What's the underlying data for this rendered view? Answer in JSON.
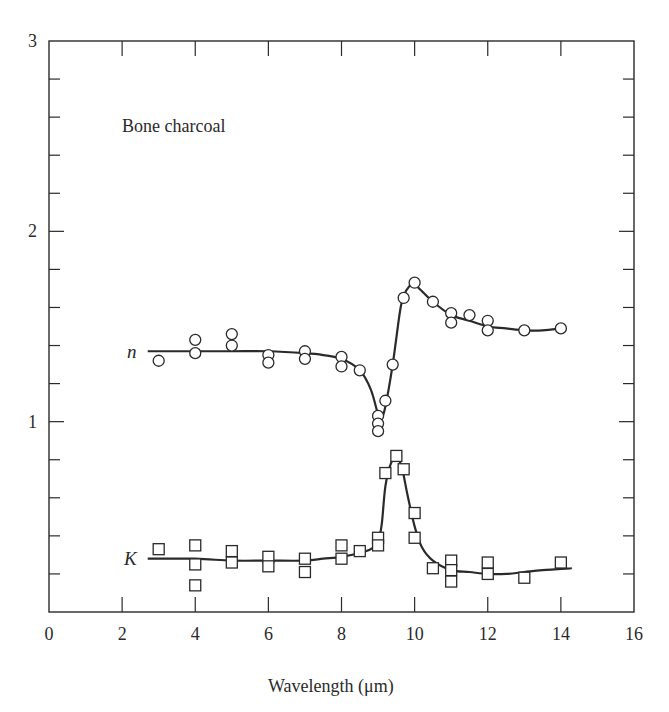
{
  "chart_data": {
    "type": "scatter",
    "title": "",
    "annotation": "Bone charcoal",
    "xlabel": "Wavelength (μm)",
    "ylabel": "",
    "xlim": [
      0,
      16
    ],
    "ylim": [
      0,
      3
    ],
    "x_ticks": [
      0,
      2,
      4,
      6,
      8,
      10,
      12,
      14,
      16
    ],
    "y_ticks": [
      1,
      2,
      3
    ],
    "y_tick_labels": [
      "0",
      "1",
      "2",
      "3"
    ],
    "x_tick_labels": [
      "0",
      "2",
      "4",
      "6",
      "8",
      "10",
      "12",
      "14",
      "16"
    ],
    "y_minor_tick_step": 0.2,
    "grid": false,
    "legend": "none (inline series labels)",
    "series": [
      {
        "name": "n",
        "marker": "circle",
        "points": [
          [
            3,
            1.32
          ],
          [
            4,
            1.43
          ],
          [
            4,
            1.36
          ],
          [
            5,
            1.46
          ],
          [
            5,
            1.4
          ],
          [
            6,
            1.35
          ],
          [
            6,
            1.31
          ],
          [
            7,
            1.37
          ],
          [
            7,
            1.33
          ],
          [
            8,
            1.34
          ],
          [
            8,
            1.29
          ],
          [
            8.5,
            1.27
          ],
          [
            9,
            1.03
          ],
          [
            9,
            0.99
          ],
          [
            9,
            0.95
          ],
          [
            9.2,
            1.11
          ],
          [
            9.4,
            1.3
          ],
          [
            9.7,
            1.65
          ],
          [
            10,
            1.73
          ],
          [
            10.5,
            1.63
          ],
          [
            11,
            1.57
          ],
          [
            11,
            1.52
          ],
          [
            11.5,
            1.56
          ],
          [
            12,
            1.53
          ],
          [
            12,
            1.48
          ],
          [
            13,
            1.48
          ],
          [
            14,
            1.49
          ]
        ],
        "fit_curve": [
          [
            2.7,
            1.37
          ],
          [
            4,
            1.37
          ],
          [
            5,
            1.37
          ],
          [
            6,
            1.37
          ],
          [
            7,
            1.36
          ],
          [
            7.5,
            1.35
          ],
          [
            8,
            1.33
          ],
          [
            8.5,
            1.27
          ],
          [
            8.8,
            1.17
          ],
          [
            9.0,
            1.04
          ],
          [
            9.1,
            1.02
          ],
          [
            9.2,
            1.08
          ],
          [
            9.4,
            1.3
          ],
          [
            9.6,
            1.58
          ],
          [
            9.7,
            1.66
          ],
          [
            9.85,
            1.71
          ],
          [
            10,
            1.72
          ],
          [
            10.5,
            1.63
          ],
          [
            11,
            1.56
          ],
          [
            11.5,
            1.53
          ],
          [
            12,
            1.5
          ],
          [
            12.5,
            1.49
          ],
          [
            13,
            1.48
          ],
          [
            13.5,
            1.48
          ],
          [
            14,
            1.49
          ]
        ]
      },
      {
        "name": "K",
        "marker": "square",
        "points": [
          [
            3,
            0.33
          ],
          [
            4,
            0.35
          ],
          [
            4,
            0.25
          ],
          [
            4,
            0.14
          ],
          [
            5,
            0.32
          ],
          [
            5,
            0.26
          ],
          [
            6,
            0.29
          ],
          [
            6,
            0.24
          ],
          [
            7,
            0.28
          ],
          [
            7,
            0.21
          ],
          [
            8,
            0.35
          ],
          [
            8,
            0.28
          ],
          [
            8.5,
            0.32
          ],
          [
            9,
            0.39
          ],
          [
            9,
            0.35
          ],
          [
            9.2,
            0.73
          ],
          [
            9.5,
            0.82
          ],
          [
            9.7,
            0.75
          ],
          [
            10,
            0.52
          ],
          [
            10,
            0.39
          ],
          [
            10.5,
            0.23
          ],
          [
            11,
            0.27
          ],
          [
            11,
            0.22
          ],
          [
            11,
            0.16
          ],
          [
            12,
            0.26
          ],
          [
            12,
            0.2
          ],
          [
            13,
            0.18
          ],
          [
            14,
            0.26
          ]
        ],
        "fit_curve": [
          [
            2.7,
            0.28
          ],
          [
            4,
            0.28
          ],
          [
            5,
            0.27
          ],
          [
            6,
            0.27
          ],
          [
            7,
            0.27
          ],
          [
            7.5,
            0.28
          ],
          [
            8,
            0.29
          ],
          [
            8.5,
            0.31
          ],
          [
            8.8,
            0.33
          ],
          [
            9.0,
            0.37
          ],
          [
            9.1,
            0.46
          ],
          [
            9.2,
            0.66
          ],
          [
            9.35,
            0.78
          ],
          [
            9.5,
            0.81
          ],
          [
            9.65,
            0.76
          ],
          [
            9.8,
            0.62
          ],
          [
            10,
            0.45
          ],
          [
            10.2,
            0.34
          ],
          [
            10.5,
            0.27
          ],
          [
            11,
            0.22
          ],
          [
            11.5,
            0.21
          ],
          [
            12,
            0.2
          ],
          [
            12.5,
            0.2
          ],
          [
            13,
            0.21
          ],
          [
            13.5,
            0.22
          ],
          [
            14.3,
            0.23
          ]
        ]
      }
    ]
  },
  "labels": {
    "annotation": "Bone charcoal",
    "series_n": "n",
    "series_k": "K",
    "x_axis_title": "Wavelength (μm)"
  },
  "style": {
    "ink": "#2a2a2a",
    "background": "#ffffff"
  }
}
